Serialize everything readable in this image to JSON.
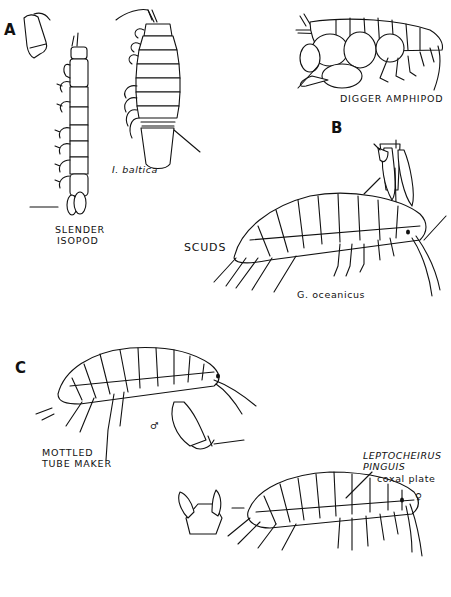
{
  "plate": {
    "sections": [
      {
        "letter": "A"
      },
      {
        "letter": "B"
      },
      {
        "letter": "C"
      }
    ],
    "labels": {
      "slender_isopod": [
        "SLENDER",
        "ISOPOD"
      ],
      "i_baltica": "I. baltica",
      "digger_amphipod": "DIGGER AMPHIPOD",
      "scuds": "SCUDS",
      "g_oceanicus": "G. oceanicus",
      "mottled_tube_maker": [
        "MOTTLED",
        "TUBE MAKER"
      ],
      "male_symbol": "♂",
      "leptocheirus": [
        "LEPTOCHEIRUS",
        "PINGUIS"
      ],
      "coxal_plate": "coxal plate",
      "female_symbol": "♀"
    },
    "colors": {
      "ink": "#111111",
      "paper": "#ffffff"
    }
  }
}
